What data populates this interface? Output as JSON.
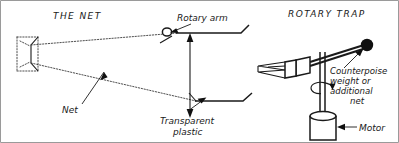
{
  "figure": {
    "title_left": "THE NET",
    "title_right": "ROTARY TRAP",
    "labels": {
      "rotary_arm": "Rotary arm",
      "net": "Net",
      "transparent_plastic_line1": "Transparent",
      "transparent_plastic_line2": "plastic",
      "counterpoise_line1": "Counterpoise",
      "counterpoise_line2": "weight  or",
      "counterpoise_line3": "additional",
      "counterpoise_line4": "net",
      "motor": "Motor"
    },
    "icons": {
      "net_mouth": "rectangular-net-frame",
      "pivot": "ring-pivot-icon",
      "double_arrow": "vertical-double-arrow-icon",
      "rotation": "curved-rotation-arrow-icon",
      "counterweight": "dark-sphere-icon",
      "motor_body": "cylinder-icon",
      "scoop": "scoop-box-icon"
    },
    "colors": {
      "ink": "#1a1a1a",
      "dotted": "#3a3a3a",
      "paper": "#ffffff",
      "border": "#9a9a9a"
    }
  }
}
